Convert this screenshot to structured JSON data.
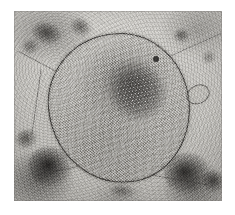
{
  "image": {
    "kind": "transmission-electron-micrograph",
    "modality": "grayscale",
    "alt_text": "Transmission electron micrograph of a large rounded membrane-bound inclusion body containing a hexagonal paracrystalline array, surrounded by granular cytoplasm with dark electron-dense chromatin clumps",
    "caption": "",
    "canvas": {
      "width_px": 235,
      "height_px": 215,
      "background_color": "#ffffff"
    },
    "plate": {
      "left_px": 14,
      "top_px": 11,
      "width_px": 208,
      "height_px": 190,
      "border_color": "#787672",
      "tone_light": "#d6d4cf",
      "tone_mid": "#b9b7b2",
      "tone_dark": "#2a2826"
    },
    "features": {
      "inclusion_body": {
        "name": "membrane-bound inclusion body",
        "left_px": 34,
        "top_px": 22,
        "width_px": 142,
        "height_px": 150,
        "membrane_color": "#2d2b28",
        "interior_color": "#b5b3ae"
      },
      "crystalline_array": {
        "name": "hexagonal paracrystalline lattice",
        "left_px": 52,
        "top_px": 30,
        "width_px": 78,
        "height_px": 72,
        "lattice_spacing_px": 3.6,
        "rotation_deg": -6
      },
      "vesicle": {
        "name": "small vesicular loop",
        "left_px": 172,
        "top_px": 74
      },
      "punctum": {
        "name": "electron-dense punctum",
        "left_px": 139,
        "top_px": 45
      },
      "chromatin_clumps": [
        {
          "name": "top-left-clump",
          "left_px": 18,
          "top_px": 12,
          "width_px": 30,
          "height_px": 22,
          "color": "#3a3836",
          "opacity": 0.8,
          "rotation_deg": 18
        },
        {
          "name": "top-left-clump-2",
          "left_px": 8,
          "top_px": 28,
          "width_px": 18,
          "height_px": 16,
          "color": "#4a4846",
          "opacity": 0.62,
          "rotation_deg": -10
        },
        {
          "name": "top-centre-clump",
          "left_px": 56,
          "top_px": 8,
          "width_px": 22,
          "height_px": 18,
          "color": "#3f3d3a",
          "opacity": 0.7,
          "rotation_deg": 32
        },
        {
          "name": "top-right-clump",
          "left_px": 160,
          "top_px": 18,
          "width_px": 16,
          "height_px": 14,
          "color": "#3b3936",
          "opacity": 0.72,
          "rotation_deg": 5
        },
        {
          "name": "right-edge-clump",
          "left_px": 188,
          "top_px": 40,
          "width_px": 15,
          "height_px": 13,
          "color": "#4b4946",
          "opacity": 0.55,
          "rotation_deg": -24
        },
        {
          "name": "bottom-left-clump",
          "left_px": 14,
          "top_px": 136,
          "width_px": 44,
          "height_px": 40,
          "color": "#232120",
          "opacity": 0.92,
          "rotation_deg": 12
        },
        {
          "name": "bottom-left-clump-2",
          "left_px": 2,
          "top_px": 118,
          "width_px": 22,
          "height_px": 20,
          "color": "#35332f",
          "opacity": 0.72,
          "rotation_deg": -18
        },
        {
          "name": "bottom-right-clump",
          "left_px": 150,
          "top_px": 142,
          "width_px": 46,
          "height_px": 40,
          "color": "#242220",
          "opacity": 0.9,
          "rotation_deg": -8
        },
        {
          "name": "bottom-right-clump-2",
          "left_px": 188,
          "top_px": 160,
          "width_px": 24,
          "height_px": 22,
          "color": "#2e2c2a",
          "opacity": 0.8,
          "rotation_deg": 26
        },
        {
          "name": "bottom-centre-clump",
          "left_px": 96,
          "top_px": 174,
          "width_px": 26,
          "height_px": 13,
          "color": "#4a4845",
          "opacity": 0.55,
          "rotation_deg": 6
        }
      ],
      "strands": [
        {
          "name": "upper-left-strand",
          "left_px": 0,
          "top_px": 54,
          "width_px": 62,
          "height_px": 1.4,
          "rotation_deg": 28
        },
        {
          "name": "upper-right-strand",
          "left_px": 150,
          "top_px": 34,
          "width_px": 60,
          "height_px": 1.3,
          "rotation_deg": -24
        },
        {
          "name": "left-vertical-strand",
          "left_px": 22,
          "top_px": 58,
          "width_px": 1.4,
          "height_px": 66,
          "rotation_deg": 8
        },
        {
          "name": "lower-strand",
          "left_px": 20,
          "top_px": 156,
          "width_px": 78,
          "height_px": 1.3,
          "rotation_deg": -12
        },
        {
          "name": "right-lower-strand",
          "left_px": 132,
          "top_px": 168,
          "width_px": 62,
          "height_px": 1.2,
          "rotation_deg": 10
        }
      ]
    }
  }
}
